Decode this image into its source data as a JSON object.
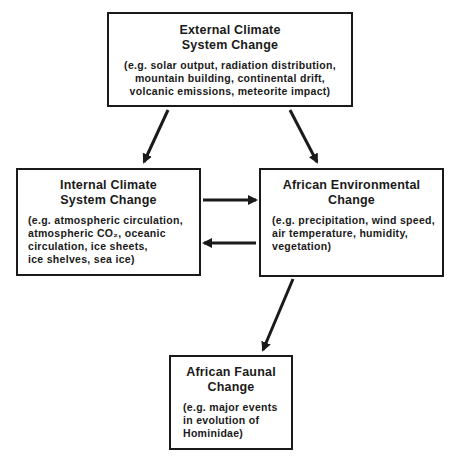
{
  "diagram": {
    "nodes": {
      "external": {
        "title": [
          "External Climate",
          "System Change"
        ],
        "examples": [
          "(e.g. solar output, radiation distribution,",
          "mountain building, continental drift,",
          "volcanic emissions, meteorite impact)"
        ]
      },
      "internal": {
        "title": [
          "Internal Climate",
          "System Change"
        ],
        "examples": [
          "(e.g. atmospheric circulation,",
          "atmospheric CO₂,  oceanic",
          "circulation, ice sheets,",
          "ice shelves, sea ice)"
        ]
      },
      "african_environmental": {
        "title": [
          "African Environmental",
          "Change"
        ],
        "examples": [
          "(e.g. precipitation, wind speed,",
          "air temperature, humidity,",
          "vegetation)"
        ]
      },
      "african_faunal": {
        "title": [
          "African Faunal",
          "Change"
        ],
        "examples": [
          "(e.g. major events",
          "in evolution of",
          "Hominidae)"
        ]
      }
    },
    "edges": [
      {
        "from": "external",
        "to": "internal"
      },
      {
        "from": "external",
        "to": "african_environmental"
      },
      {
        "from": "internal",
        "to": "african_environmental"
      },
      {
        "from": "african_environmental",
        "to": "internal"
      },
      {
        "from": "african_environmental",
        "to": "african_faunal"
      }
    ],
    "colors": {
      "stroke": "#1a1a1a",
      "background": "#ffffff"
    }
  }
}
